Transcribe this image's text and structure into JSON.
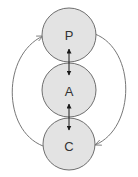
{
  "diagram": {
    "nodes": [
      {
        "id": "P",
        "label": "P"
      },
      {
        "id": "A",
        "label": "A"
      },
      {
        "id": "C",
        "label": "C"
      }
    ],
    "edges": [
      {
        "from": "P",
        "to": "A",
        "type": "bidirectional-arrow"
      },
      {
        "from": "A",
        "to": "C",
        "type": "bidirectional-arrow"
      },
      {
        "from": "C",
        "to": "P",
        "type": "curved-arrow",
        "side": "left"
      },
      {
        "from": "P",
        "to": "C",
        "type": "curved-arrow",
        "side": "right"
      }
    ],
    "colors": {
      "node_fill": "#e3e3e3",
      "node_stroke": "#6e6e6e",
      "label": "#333333",
      "link": "#1a1a1a",
      "arc": "#777777",
      "background": "#ffffff"
    }
  }
}
